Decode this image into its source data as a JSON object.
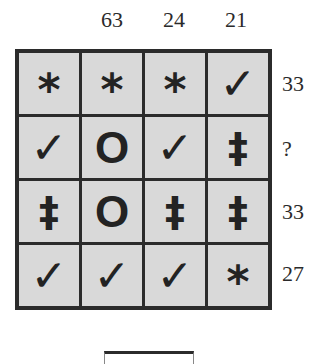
{
  "puzzle": {
    "column_totals": [
      "",
      "63",
      "24",
      "21"
    ],
    "row_totals": [
      "33",
      "?",
      "33",
      "27"
    ],
    "symbols": {
      "star": "*",
      "check": "✓",
      "o": "O",
      "ddagger": "‡"
    },
    "grid": [
      [
        {
          "type": "star",
          "glyph": "*"
        },
        {
          "type": "star",
          "glyph": "*"
        },
        {
          "type": "star",
          "glyph": "*"
        },
        {
          "type": "check",
          "glyph": "✓"
        }
      ],
      [
        {
          "type": "check",
          "glyph": "✓"
        },
        {
          "type": "o",
          "glyph": "O"
        },
        {
          "type": "check",
          "glyph": "✓"
        },
        {
          "type": "ddagger",
          "glyph": "‡"
        }
      ],
      [
        {
          "type": "ddagger",
          "glyph": "‡"
        },
        {
          "type": "o",
          "glyph": "O"
        },
        {
          "type": "ddagger",
          "glyph": "‡"
        },
        {
          "type": "ddagger",
          "glyph": "‡"
        }
      ],
      [
        {
          "type": "check",
          "glyph": "✓"
        },
        {
          "type": "check",
          "glyph": "✓"
        },
        {
          "type": "check",
          "glyph": "✓"
        },
        {
          "type": "star",
          "glyph": "*"
        }
      ]
    ],
    "answer": ""
  },
  "colors": {
    "cell_fill": "#d9d9d9",
    "border": "#2b2b2b",
    "text": "#2a2a2a"
  }
}
